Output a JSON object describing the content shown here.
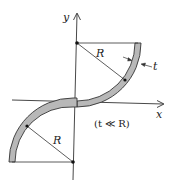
{
  "diagram": {
    "labels": {
      "y_axis": "y",
      "x_axis": "x",
      "radius_upper": "R",
      "radius_lower": "R",
      "thickness": "t",
      "condition": "(t ≪ R)"
    },
    "colors": {
      "strip_fill": "#b8b8b8",
      "strip_stroke": "#333333",
      "line": "#333333"
    }
  }
}
